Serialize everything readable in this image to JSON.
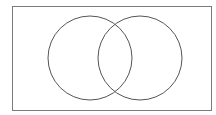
{
  "diagram": {
    "type": "venn",
    "sets": 2,
    "labels": [],
    "frame": {
      "x": 12.5,
      "y": 6.5,
      "width": 199,
      "height": 104,
      "stroke": "#7a7a7a"
    },
    "circles": [
      {
        "name": "left-set",
        "cx": 90,
        "cy": 58,
        "r": 42,
        "stroke": "#555555"
      },
      {
        "name": "right-set",
        "cx": 140,
        "cy": 58,
        "r": 42,
        "stroke": "#555555"
      }
    ],
    "background": "#ffffff"
  }
}
